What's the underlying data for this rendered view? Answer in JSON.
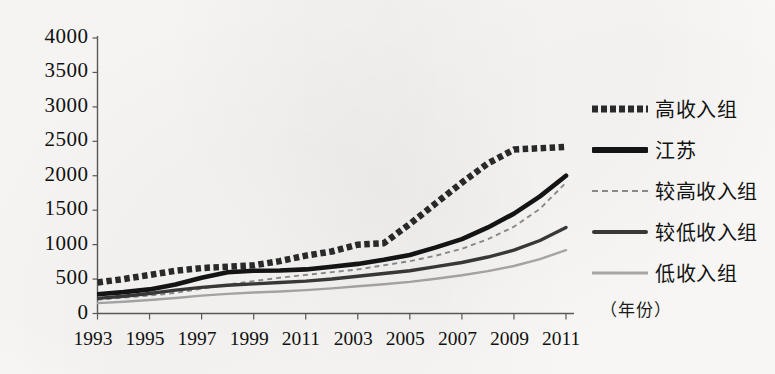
{
  "chart_data": {
    "type": "line",
    "title": "",
    "subtitle": "",
    "xlabel": "（年份）",
    "ylabel": "",
    "xlim": [
      1993,
      2011
    ],
    "ylim": [
      0,
      4000
    ],
    "grid": false,
    "legend_position": "right",
    "x": [
      1993,
      1994,
      1995,
      1996,
      1997,
      1998,
      1999,
      2000,
      2001,
      2002,
      2003,
      2004,
      2005,
      2006,
      2007,
      2008,
      2009,
      2010,
      2011
    ],
    "xtick_labels": [
      "1993",
      "1995",
      "1997",
      "1999",
      "2011",
      "2003",
      "2005",
      "2007",
      "2009",
      "2011"
    ],
    "xtick_values": [
      1993,
      1995,
      1997,
      1999,
      2001,
      2003,
      2005,
      2007,
      2009,
      2011
    ],
    "ytick_labels": [
      "0",
      "500",
      "1000",
      "1500",
      "2000",
      "2500",
      "3000",
      "3500",
      "4000"
    ],
    "ytick_values": [
      0,
      500,
      1000,
      1500,
      2000,
      2500,
      3000,
      3500,
      4000
    ],
    "series": [
      {
        "name": "高收入组",
        "style": "dotted-thick",
        "color": "#2b2b2b",
        "values": [
          450,
          500,
          560,
          620,
          660,
          680,
          700,
          760,
          840,
          900,
          1000,
          1020,
          1300,
          1600,
          1900,
          2180,
          2380,
          2400,
          2420
        ]
      },
      {
        "name": "江苏",
        "style": "solid-thick",
        "color": "#141414",
        "values": [
          280,
          310,
          350,
          420,
          520,
          600,
          620,
          625,
          640,
          680,
          720,
          780,
          850,
          960,
          1080,
          1250,
          1450,
          1700,
          2000
        ]
      },
      {
        "name": "较高收入组",
        "style": "dashed-thin",
        "color": "#8d8d8d",
        "values": [
          200,
          230,
          260,
          300,
          360,
          420,
          470,
          520,
          560,
          600,
          640,
          700,
          760,
          840,
          940,
          1080,
          1260,
          1520,
          1900
        ]
      },
      {
        "name": "较低收入组",
        "style": "solid-medium",
        "color": "#3a3a3a",
        "values": [
          220,
          250,
          290,
          340,
          380,
          410,
          430,
          450,
          470,
          500,
          540,
          580,
          620,
          680,
          740,
          820,
          920,
          1060,
          1250
        ]
      },
      {
        "name": "低收入组",
        "style": "solid-light",
        "color": "#a9a9a9",
        "values": [
          150,
          170,
          195,
          225,
          260,
          285,
          305,
          320,
          340,
          365,
          395,
          425,
          460,
          505,
          555,
          615,
          690,
          790,
          920
        ]
      }
    ],
    "series_full": [
      {
        "name": "高收入组",
        "values": [
          450,
          520,
          600,
          660,
          700,
          720,
          760,
          840,
          940,
          1000,
          1120,
          1350,
          1700,
          2050,
          2380,
          2400,
          2700,
          3050,
          3400,
          3800
        ]
      }
    ]
  },
  "legend": {
    "items": [
      {
        "label": "高收入组",
        "style": "dotted-thick"
      },
      {
        "label": "江苏",
        "style": "solid-thick"
      },
      {
        "label": "较高收入组",
        "style": "dashed-thin"
      },
      {
        "label": "较低收入组",
        "style": "solid-medium"
      },
      {
        "label": "低收入组",
        "style": "solid-light"
      }
    ]
  }
}
